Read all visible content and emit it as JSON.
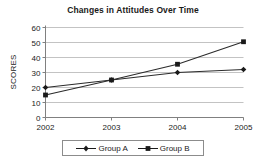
{
  "chart_data": {
    "type": "line",
    "title": "Changes in Attitudes Over Time",
    "xlabel": "",
    "ylabel": "SCORES",
    "categories": [
      "2002",
      "2003",
      "2004",
      "2005"
    ],
    "series": [
      {
        "name": "Group A",
        "marker": "diamond",
        "color": "#1a1a1a",
        "values": [
          20,
          25,
          30,
          32
        ]
      },
      {
        "name": "Group B",
        "marker": "square",
        "color": "#1a1a1a",
        "values": [
          15,
          25,
          35.5,
          50.5
        ]
      }
    ],
    "ylim": [
      0,
      60
    ],
    "yticks": [
      "0",
      "10",
      "20",
      "30",
      "40",
      "50",
      "60"
    ],
    "ytick_values": [
      0,
      10,
      20,
      30,
      40,
      50,
      60
    ],
    "grid": true,
    "legend_position": "bottom"
  },
  "legend": {
    "entries": [
      {
        "label": "Group A",
        "marker_icon": "diamond-marker-icon"
      },
      {
        "label": "Group B",
        "marker_icon": "square-marker-icon"
      }
    ]
  }
}
